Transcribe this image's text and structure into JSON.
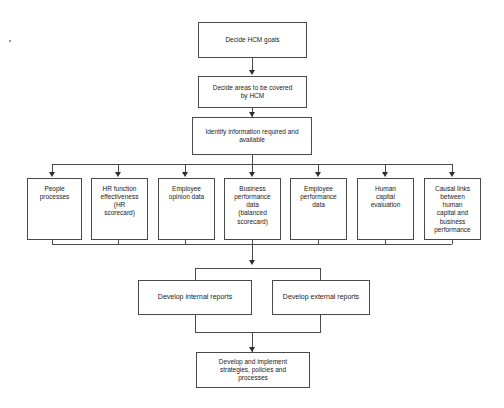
{
  "diagram": {
    "colors": {
      "box_border": "#4a4a4a",
      "connector": "#4a4a4a",
      "arrow": "#2e2e2e",
      "text": "#1a1a1a",
      "background": "#ffffff"
    },
    "top_nodes": [
      {
        "id": "decide-hcm-goals",
        "label": "Decide HCM goals"
      },
      {
        "id": "decide-areas-covered",
        "label": "Decide areas to be covered\nby HCM"
      },
      {
        "id": "identify-information",
        "label": "Identify information required and\navailable"
      }
    ],
    "data_sources": [
      {
        "id": "people-processes",
        "label": "People\nprocesses"
      },
      {
        "id": "hr-function-effectiveness",
        "label": "HR function\neffectiveness\n(HR\nscorecard)"
      },
      {
        "id": "employee-opinion-data",
        "label": "Employee\nopinion data"
      },
      {
        "id": "business-performance-data",
        "label": "Business\nperformance\ndata\n(balanced\nscorecard)"
      },
      {
        "id": "employee-performance-data",
        "label": "Employee\nperformance\ndata"
      },
      {
        "id": "human-capital-evaluation",
        "label": "Human\ncapital\nevaluation"
      },
      {
        "id": "causal-links",
        "label": "Causal links\nbetween\nhuman\ncapital and\nbusiness\nperformance"
      }
    ],
    "report_nodes": [
      {
        "id": "develop-internal-reports",
        "label": "Develop internal reports"
      },
      {
        "id": "develop-external-reports",
        "label": "Develop external reports"
      }
    ],
    "final_node": {
      "id": "develop-implement-strategies",
      "label": "Develop and implement\nstrategies, policies and\nprocesses"
    }
  }
}
